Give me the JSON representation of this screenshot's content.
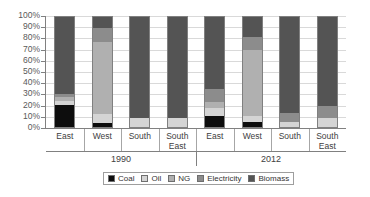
{
  "chart_data": {
    "type": "bar",
    "subtype": "100% stacked column",
    "title": "",
    "xlabel": "",
    "ylabel": "",
    "ylim": [
      0,
      100
    ],
    "y_unit": "%",
    "grid": true,
    "legend_position": "bottom",
    "y_ticks": [
      "0%",
      "10%",
      "20%",
      "30%",
      "40%",
      "50%",
      "60%",
      "70%",
      "80%",
      "90%",
      "100%"
    ],
    "y_tick_values": [
      0,
      10,
      20,
      30,
      40,
      50,
      60,
      70,
      80,
      90,
      100
    ],
    "groups": [
      "1990",
      "2012"
    ],
    "categories": [
      "East",
      "West",
      "South",
      "South East",
      "East",
      "West",
      "South",
      "South East"
    ],
    "series": [
      {
        "name": "Coal",
        "color": "#0d0d0d",
        "values": [
          20,
          4,
          0,
          0,
          10,
          5,
          0,
          0
        ]
      },
      {
        "name": "Oil",
        "color": "#d4d4d4",
        "values": [
          4,
          8,
          8,
          8,
          7,
          5,
          5,
          8
        ]
      },
      {
        "name": "NG",
        "color": "#b0b0b0",
        "values": [
          3,
          65,
          0,
          0,
          6,
          60,
          0,
          0
        ]
      },
      {
        "name": "Electricity",
        "color": "#8c8c8c",
        "values": [
          3,
          13,
          0,
          0,
          12,
          12,
          8,
          11
        ]
      },
      {
        "name": "Biomass",
        "color": "#545454",
        "values": [
          70,
          10,
          92,
          92,
          65,
          18,
          87,
          81
        ]
      }
    ],
    "bars": [
      {
        "group": "1990",
        "category": "East",
        "segments": [
          {
            "series": "Coal",
            "value": 20
          },
          {
            "series": "Oil",
            "value": 4
          },
          {
            "series": "NG",
            "value": 3
          },
          {
            "series": "Electricity",
            "value": 3
          },
          {
            "series": "Biomass",
            "value": 70
          }
        ]
      },
      {
        "group": "1990",
        "category": "West",
        "segments": [
          {
            "series": "Coal",
            "value": 4
          },
          {
            "series": "Oil",
            "value": 8
          },
          {
            "series": "NG",
            "value": 65
          },
          {
            "series": "Electricity",
            "value": 13
          },
          {
            "series": "Biomass",
            "value": 10
          }
        ]
      },
      {
        "group": "1990",
        "category": "South",
        "segments": [
          {
            "series": "Coal",
            "value": 0
          },
          {
            "series": "Oil",
            "value": 8
          },
          {
            "series": "NG",
            "value": 0
          },
          {
            "series": "Electricity",
            "value": 0
          },
          {
            "series": "Biomass",
            "value": 92
          }
        ]
      },
      {
        "group": "1990",
        "category": "South East",
        "segments": [
          {
            "series": "Coal",
            "value": 0
          },
          {
            "series": "Oil",
            "value": 8
          },
          {
            "series": "NG",
            "value": 0
          },
          {
            "series": "Electricity",
            "value": 0
          },
          {
            "series": "Biomass",
            "value": 92
          }
        ]
      },
      {
        "group": "2012",
        "category": "East",
        "segments": [
          {
            "series": "Coal",
            "value": 10
          },
          {
            "series": "Oil",
            "value": 7
          },
          {
            "series": "NG",
            "value": 6
          },
          {
            "series": "Electricity",
            "value": 12
          },
          {
            "series": "Biomass",
            "value": 65
          }
        ]
      },
      {
        "group": "2012",
        "category": "West",
        "segments": [
          {
            "series": "Coal",
            "value": 5
          },
          {
            "series": "Oil",
            "value": 5
          },
          {
            "series": "NG",
            "value": 60
          },
          {
            "series": "Electricity",
            "value": 12
          },
          {
            "series": "Biomass",
            "value": 18
          }
        ]
      },
      {
        "group": "2012",
        "category": "South",
        "segments": [
          {
            "series": "Coal",
            "value": 0
          },
          {
            "series": "Oil",
            "value": 5
          },
          {
            "series": "NG",
            "value": 0
          },
          {
            "series": "Electricity",
            "value": 8
          },
          {
            "series": "Biomass",
            "value": 87
          }
        ]
      },
      {
        "group": "2012",
        "category": "South East",
        "segments": [
          {
            "series": "Coal",
            "value": 0
          },
          {
            "series": "Oil",
            "value": 8
          },
          {
            "series": "NG",
            "value": 0
          },
          {
            "series": "Electricity",
            "value": 11
          },
          {
            "series": "Biomass",
            "value": 81
          }
        ]
      }
    ]
  },
  "legend": {
    "items": [
      {
        "label": "Coal",
        "color": "#0d0d0d"
      },
      {
        "label": "Oil",
        "color": "#d4d4d4"
      },
      {
        "label": "NG",
        "color": "#b0b0b0"
      },
      {
        "label": "Electricity",
        "color": "#8c8c8c"
      },
      {
        "label": "Biomass",
        "color": "#545454"
      }
    ]
  },
  "colors": {
    "gridline": "#d9d9d9",
    "axis": "#808080",
    "text": "#404040",
    "background": "#ffffff"
  }
}
